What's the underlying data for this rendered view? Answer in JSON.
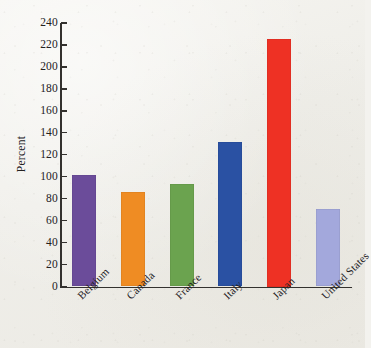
{
  "chart_data": {
    "type": "bar",
    "title": "",
    "subtitle": "",
    "xlabel": "",
    "ylabel": "Percent",
    "categories": [
      "Belgium",
      "Canada",
      "France",
      "Italy",
      "Japan",
      "United States"
    ],
    "values": [
      102,
      86,
      93,
      132,
      225,
      71
    ],
    "series": [
      {
        "name": "Percent",
        "values": [
          102,
          86,
          93,
          132,
          225,
          71
        ]
      }
    ],
    "ylim": [
      0,
      240
    ],
    "ytick_step": 20,
    "yticks": [
      0,
      20,
      40,
      60,
      80,
      100,
      120,
      140,
      160,
      180,
      200,
      220,
      240
    ],
    "ytick_labels": [
      "0",
      "20",
      "40",
      "60",
      "80",
      "100",
      "120",
      "140",
      "160",
      "180",
      "200",
      "220",
      "240"
    ],
    "grid": false,
    "legend": false,
    "legend_position": "none",
    "xtick_label_rotation": -45,
    "bar_colors": [
      "#6b4c9a",
      "#ef8c23",
      "#6ba34f",
      "#2a51a3",
      "#ee3124",
      "#a3a8dc"
    ],
    "bars": [
      {
        "category": "Belgium",
        "value": 102,
        "color": "#6b4c9a"
      },
      {
        "category": "Canada",
        "value": 86,
        "color": "#ef8c23"
      },
      {
        "category": "France",
        "value": 93,
        "color": "#6ba34f"
      },
      {
        "category": "Italy",
        "value": 132,
        "color": "#2a51a3"
      },
      {
        "category": "Japan",
        "value": 225,
        "color": "#ee3124"
      },
      {
        "category": "United States",
        "value": 71,
        "color": "#a3a8dc"
      }
    ],
    "axis_color": "#33312e",
    "background_color": "#f1f0eb"
  }
}
